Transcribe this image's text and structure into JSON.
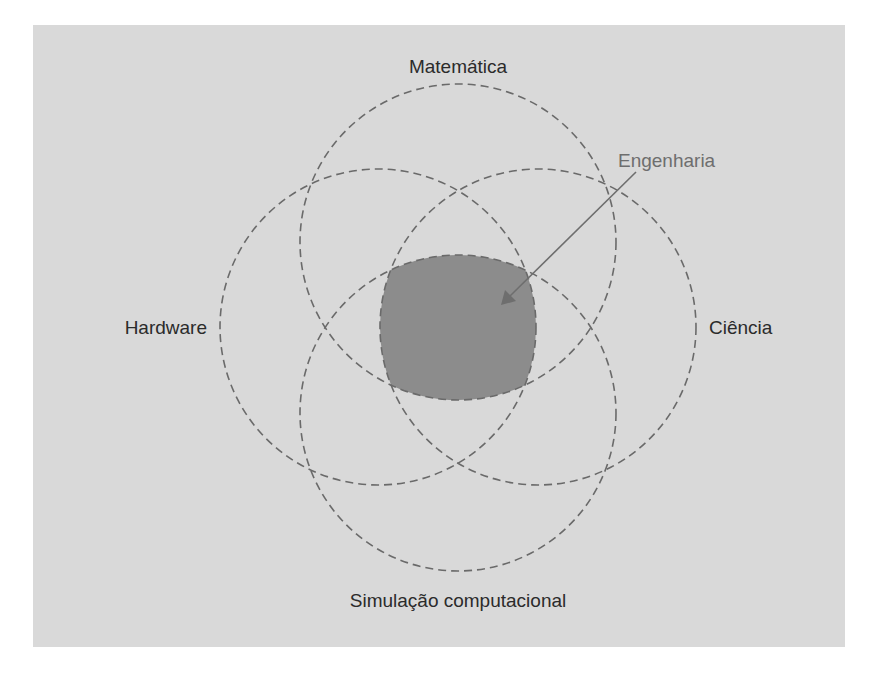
{
  "diagram": {
    "type": "venn",
    "sets": [
      {
        "id": "top",
        "label": "Matemática"
      },
      {
        "id": "left",
        "label": "Hardware"
      },
      {
        "id": "right",
        "label": "Ciência"
      },
      {
        "id": "bottom",
        "label": "Simulação computacional"
      }
    ],
    "intersection": {
      "label": "Engenharia",
      "description": "Intersection of all four sets"
    },
    "colors": {
      "background": "#d9d9d9",
      "circle_stroke": "#6a6a6a",
      "intersection_fill": "#8c8c8c",
      "label_text": "#2b2b2b",
      "callout_text": "#6e6e6e"
    }
  }
}
